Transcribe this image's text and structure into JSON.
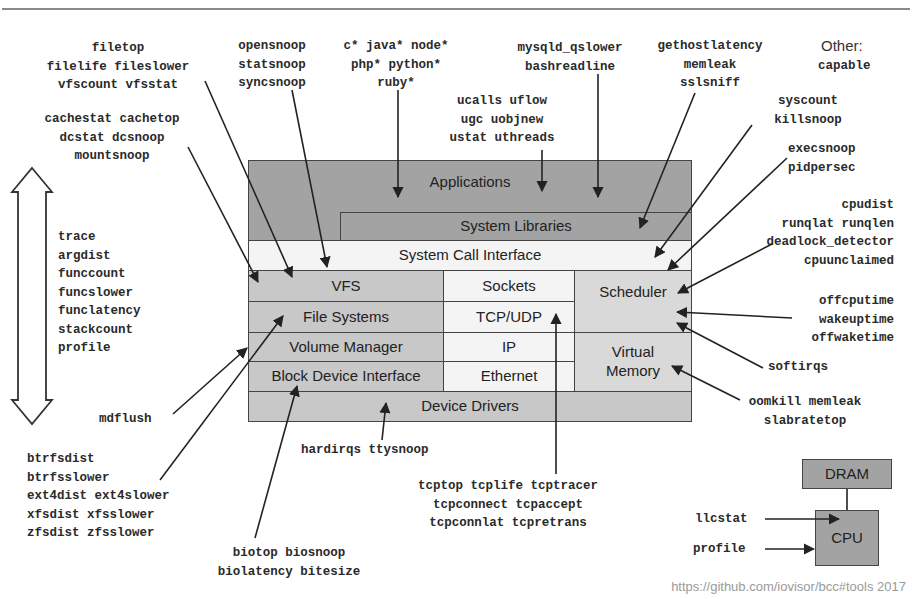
{
  "diagram": {
    "title_fragment": "g",
    "stack": {
      "applications": "Applications",
      "system_libraries": "System Libraries",
      "system_call_interface": "System Call Interface",
      "vfs": "VFS",
      "file_systems": "File Systems",
      "volume_manager": "Volume Manager",
      "block_device_interface": "Block Device Interface",
      "sockets": "Sockets",
      "tcp_udp": "TCP/UDP",
      "ip": "IP",
      "ethernet": "Ethernet",
      "scheduler": "Scheduler",
      "virtual_memory": "Virtual\nMemory",
      "device_drivers": "Device Drivers"
    },
    "hardware": {
      "dram": "DRAM",
      "cpu": "CPU",
      "llcstat": "llcstat",
      "profile": "profile"
    },
    "tool_groups": {
      "vfs_file": "filetop\nfilelife fileslower\nvfscount vfsstat",
      "cache": "cachestat cachetop\ndcstat dcsnoop\nmountsnoop",
      "opensnoop": "opensnoop\nstatsnoop\nsyncsnoop",
      "languages": "c* java* node*\nphp* python*\nruby*",
      "ucalls": "ucalls uflow\nugc uobjnew\nustat uthreads",
      "mysqld": "mysqld_qslower\nbashreadline",
      "gethost": "gethostlatency\nmemleak\nsslsniff",
      "other_label": "Other:",
      "other_tools": "capable",
      "syscount": "syscount\nkillsnoop",
      "execsnoop": "execsnoop\npidpersec",
      "cpudist": "cpudist\nrunqlat runqlen\ndeadlock_detector\ncpuunclaimed",
      "offcpu": "offcputime\nwakeuptime\noffwaketime",
      "softirqs": "softirqs",
      "oomkill": "oomkill memleak\nslabratetop",
      "multi_tools": "trace\nargdist\nfunccount\nfuncslower\nfunclatency\nstackcount\nprofile",
      "mdflush": "mdflush",
      "fs_tools": "btrfsdist\nbtrfsslower\next4dist ext4slower\nxfsdist xfsslower\nzfsdist zfsslower",
      "hardirqs": "hardirqs ttysnoop",
      "tcp": "tcptop tcplife tcptracer\ntcpconnect tcpaccept\ntcpconnlat tcpretrans",
      "bio": "biotop biosnoop\nbiolatency bitesize"
    },
    "source": "https://github.com/iovisor/bcc#tools 2017",
    "colors": {
      "dark_layer": "#a3a3a3",
      "mid_layer": "#c8c8c8",
      "light_layer": "#d9d9d9",
      "white_layer": "#f4f4f4",
      "line": "#222222"
    }
  }
}
